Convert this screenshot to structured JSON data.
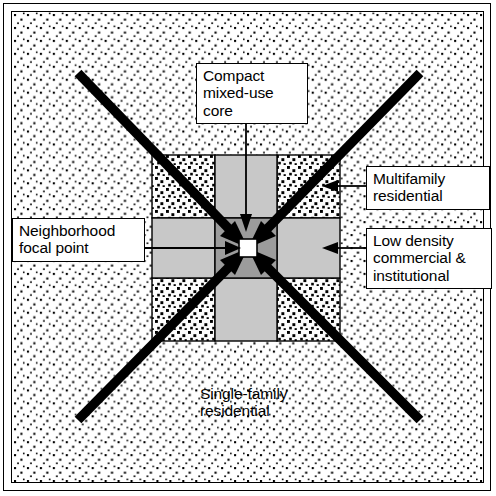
{
  "figure": {
    "type": "neighborhood-structure-diagram"
  },
  "labels": {
    "compact_core": "Compact\nmixed-use\ncore",
    "multifamily": "Multifamily\nresidential",
    "low_density": "Low density\ncommercial &\ninstitutional",
    "focal_point": "Neighborhood\nfocal point",
    "single_family": "Single-family\nresidential"
  },
  "zones": [
    {
      "name": "compact-mixed-use-core",
      "fill": "#9a9a9a",
      "position": "center"
    },
    {
      "name": "low-density-commercial-institutional",
      "fill": "#c6c6c6",
      "position": "edge-midpoints"
    },
    {
      "name": "multifamily-residential",
      "fill": "coarse-stipple",
      "position": "grid-corners"
    },
    {
      "name": "single-family-residential",
      "fill": "fine-stipple",
      "position": "surrounding-field"
    },
    {
      "name": "neighborhood-focal-point",
      "fill": "#ffffff",
      "position": "center-point"
    }
  ],
  "colors": {
    "core_gray": "#9a9a9a",
    "commercial_gray": "#c6c6c6",
    "focal_white": "#ffffff",
    "ink": "#000000",
    "background": "#ffffff"
  },
  "arrows": {
    "diagonal_count": 4,
    "diagonal_description": "Four thick diagonal corridors converging on the neighborhood focal point",
    "leader_count": 4,
    "leader_description": "Thin leader lines from callout labels to the zones they describe"
  }
}
